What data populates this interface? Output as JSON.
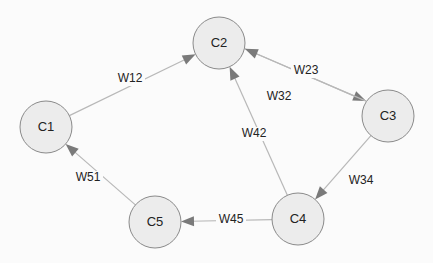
{
  "diagram": {
    "type": "directed-graph",
    "style": {
      "node_fill": "#ececec",
      "node_stroke": "#8a8a8a",
      "edge_color": "#b8b8b8",
      "arrow_color": "#7a7a7a",
      "text_color": "#222222"
    },
    "nodes": [
      {
        "id": "C1",
        "label": "C1",
        "x": 46,
        "y": 127
      },
      {
        "id": "C2",
        "label": "C2",
        "x": 219,
        "y": 43
      },
      {
        "id": "C3",
        "label": "C3",
        "x": 388,
        "y": 116
      },
      {
        "id": "C4",
        "label": "C4",
        "x": 298,
        "y": 219
      },
      {
        "id": "C5",
        "label": "C5",
        "x": 155,
        "y": 222
      }
    ],
    "edges": [
      {
        "from": "C1",
        "to": "C2",
        "label": "W12",
        "lx": 130,
        "ly": 79
      },
      {
        "from": "C2",
        "to": "C3",
        "label": "W23",
        "lx": 306,
        "ly": 71
      },
      {
        "from": "C3",
        "to": "C2",
        "label": "W32",
        "lx": 279,
        "ly": 97
      },
      {
        "from": "C4",
        "to": "C2",
        "label": "W42",
        "lx": 254,
        "ly": 134
      },
      {
        "from": "C3",
        "to": "C4",
        "label": "W34",
        "lx": 361,
        "ly": 181
      },
      {
        "from": "C4",
        "to": "C5",
        "label": "W45",
        "lx": 231,
        "ly": 220
      },
      {
        "from": "C5",
        "to": "C1",
        "label": "W51",
        "lx": 88,
        "ly": 178
      }
    ]
  }
}
